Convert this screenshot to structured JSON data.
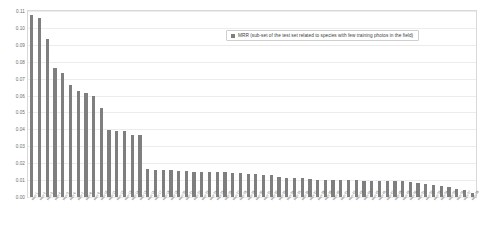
{
  "chart": {
    "type": "bar",
    "title": "",
    "legend_position": "top-right",
    "legend_label": "MRR (sub-set of the test set related to species with few training photos in the field)",
    "legend_swatch_color": "#7f7f7f",
    "bar_color": "#7f7f7f",
    "grid": true,
    "xlabel": "",
    "ylabel": ""
  },
  "yaxis": {
    "min": 0,
    "max": 0.11,
    "ticks": [
      "0.00",
      "0.01",
      "0.02",
      "0.03",
      "0.04",
      "0.05",
      "0.06",
      "0.07",
      "0.08",
      "0.09",
      "0.10",
      "0.11"
    ],
    "tick_values": [
      0,
      0.01,
      0.02,
      0.03,
      0.04,
      0.05,
      0.06,
      0.07,
      0.08,
      0.09,
      0.1,
      0.11
    ]
  },
  "chart_data": {
    "type": "bar",
    "title": "",
    "xlabel": "",
    "ylabel": "",
    "ylim": [
      0,
      0.11
    ],
    "grid": true,
    "legend_position": "top-right",
    "series": [
      {
        "name": "MRR (sub-set of the test set related to species with few training photos in the field)",
        "color": "#7f7f7f",
        "values": [
          0.1075,
          0.106,
          0.0935,
          0.0765,
          0.0735,
          0.066,
          0.0625,
          0.0615,
          0.06,
          0.0525,
          0.0395,
          0.039,
          0.0388,
          0.0368,
          0.0366,
          0.0165,
          0.016,
          0.0158,
          0.0157,
          0.0156,
          0.0155,
          0.015,
          0.0148,
          0.0147,
          0.0146,
          0.0145,
          0.0143,
          0.014,
          0.0138,
          0.0135,
          0.0132,
          0.0128,
          0.0118,
          0.0113,
          0.0112,
          0.011,
          0.0105,
          0.0103,
          0.0102,
          0.0101,
          0.01,
          0.0099,
          0.0098,
          0.0097,
          0.0096,
          0.0095,
          0.0094,
          0.0093,
          0.0092,
          0.009,
          0.0082,
          0.0078,
          0.0072,
          0.0068,
          0.0062,
          0.005,
          0.004,
          0.0022
        ]
      }
    ],
    "categories": [
      "Run 1",
      "Run 2",
      "Run 3",
      "Run 4",
      "Run 5",
      "Run 6",
      "Run 7",
      "Run 8",
      "Run 9",
      "Run 10",
      "Run 11",
      "Run 12",
      "Run 13",
      "Run 14",
      "Run 15",
      "Run 16",
      "Run 17",
      "Run 18",
      "Run 19",
      "Run 20",
      "Run 21",
      "Run 22",
      "Run 23",
      "Run 24",
      "Run 25",
      "Run 26",
      "Run 27",
      "Run 28",
      "Run 29",
      "Run 30",
      "Run 31",
      "Run 32",
      "Run 33",
      "Run 34",
      "Run 35",
      "Run 36",
      "Run 37",
      "Run 38",
      "Run 39",
      "Run 40",
      "Run 41",
      "Run 42",
      "Run 43",
      "Run 44",
      "Run 45",
      "Run 46",
      "Run 47",
      "Run 48",
      "Run 49",
      "Run 50",
      "Run 51",
      "Run 52",
      "Run 53",
      "Run 54",
      "Run 55",
      "Run 56",
      "Run 57",
      "Run 58"
    ]
  }
}
